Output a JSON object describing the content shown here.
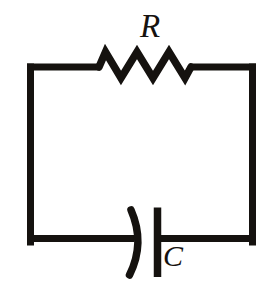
{
  "figure": {
    "kind": "circuit-diagram",
    "background_color": "#ffffff",
    "stroke_color": "#15120f",
    "width": 269,
    "height": 289
  },
  "labels": {
    "resistor": "R",
    "capacitor": "C"
  },
  "components": [
    {
      "id": "resistor",
      "symbol_name": "resistor-zigzag-icon",
      "label": "R",
      "position": "top-branch",
      "teeth": 3
    },
    {
      "id": "capacitor",
      "symbol_name": "capacitor-polarized-icon",
      "label": "C",
      "position": "bottom-branch",
      "plates": [
        "curved",
        "straight"
      ]
    }
  ],
  "loop": {
    "name": "wire-loop",
    "left_x": 27,
    "right_x": 256,
    "top_y": 67,
    "bottom_y": 242,
    "stroke_width": 7
  },
  "geometry": {
    "top_wire_left": "M 27 67 L 97 67",
    "resistor_zigzag": "M 97 67 L 105 52 L 121 78 L 137 52 L 153 78 L 169 52 L 185 78 L 192 67",
    "top_wire_right": "M 192 67 L 256 67",
    "left_wire": "M 30.5 67 L 30.5 242",
    "right_wire": "M 252.5 67 L 252.5 242",
    "bottom_wire_left": "M 27 238.5 L 133 238.5",
    "bottom_wire_right": "M 157 238.5 L 256 238.5",
    "capacitor_curved_plate": "M 131 209 Q 146 243 130 276",
    "capacitor_straight_plate": "M 157.5 207 L 157.5 277"
  }
}
